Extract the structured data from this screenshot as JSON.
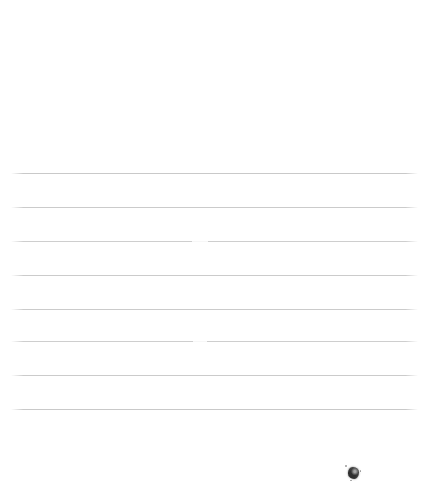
{
  "page": {
    "kind": "scanned-ruled-paper",
    "width": 423,
    "height": 481,
    "background_color": "#ffffff",
    "text_content": "",
    "notes_label": ""
  },
  "rules": {
    "label": "ruled-lines",
    "count": 8,
    "color": "#c9c9c9",
    "left_x": 11,
    "right_x": 418,
    "thickness": 1,
    "spacing": 34,
    "lines": [
      {
        "id": "rule-1",
        "y": 173,
        "left": 11,
        "right": 418,
        "opacity": 1.0,
        "break": null
      },
      {
        "id": "rule-2",
        "y": 207,
        "left": 11,
        "right": 418,
        "opacity": 0.95,
        "break": null
      },
      {
        "id": "rule-3",
        "y": 241,
        "left": 11,
        "right": 418,
        "opacity": 0.9,
        "break": {
          "x": 192,
          "width": 16
        }
      },
      {
        "id": "rule-4",
        "y": 275,
        "left": 11,
        "right": 418,
        "opacity": 0.95,
        "break": null
      },
      {
        "id": "rule-5",
        "y": 309,
        "left": 11,
        "right": 418,
        "opacity": 0.95,
        "break": null
      },
      {
        "id": "rule-6",
        "y": 341,
        "left": 11,
        "right": 418,
        "opacity": 0.9,
        "break": {
          "x": 193,
          "width": 14
        }
      },
      {
        "id": "rule-7",
        "y": 375,
        "left": 11,
        "right": 418,
        "opacity": 0.95,
        "break": null
      },
      {
        "id": "rule-8",
        "y": 409,
        "left": 11,
        "right": 418,
        "opacity": 1.0,
        "break": null
      }
    ]
  },
  "smudge": {
    "label": "ink-smudge",
    "x": 348,
    "y": 467,
    "width": 11,
    "height": 12,
    "color": "#4a4a4a"
  }
}
